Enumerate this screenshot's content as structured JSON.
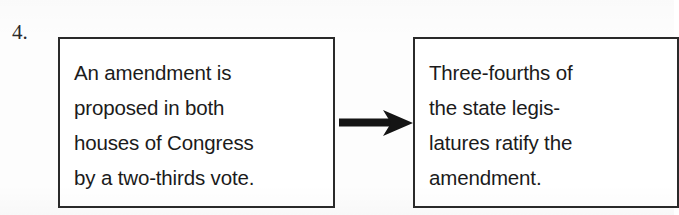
{
  "figure": {
    "item_number": "4.",
    "type": "flow-diagram",
    "background_color": "#fdfdfd",
    "border_color": "#2a2a2a",
    "text_color": "#1b1b1b"
  },
  "boxes": [
    {
      "id": "propose",
      "name": "amendment-proposal-box",
      "lines": [
        "An amendment is",
        "proposed in both",
        "houses of Congress",
        "by a two-thirds vote."
      ],
      "full_text": "An amendment is proposed in both houses of Congress by a two-thirds vote."
    },
    {
      "id": "ratify",
      "name": "amendment-ratification-box",
      "lines": [
        "Three-fourths of",
        "the state legis-",
        "latures ratify the",
        "amendment."
      ],
      "full_text": "Three-fourths of the state legislatures ratify the amendment."
    }
  ],
  "connector": {
    "name": "arrow-right-icon",
    "direction": "right",
    "color": "#141414"
  }
}
